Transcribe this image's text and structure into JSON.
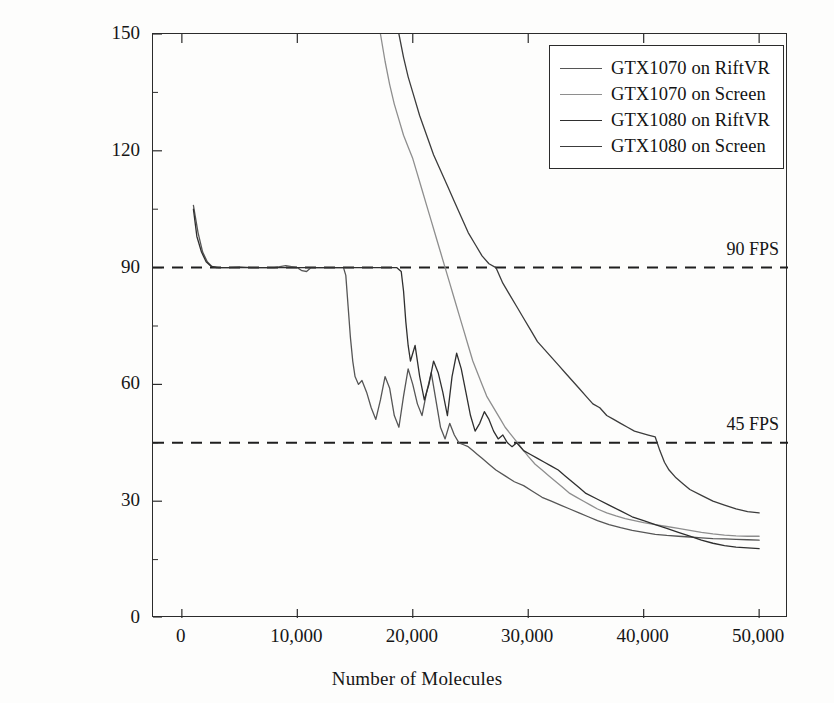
{
  "chart_data": {
    "type": "line",
    "title": "",
    "xlabel": "Number of Molecules",
    "ylabel": "Frames per Second (fps)",
    "xlim": [
      -2500,
      52500
    ],
    "ylim": [
      0,
      150
    ],
    "xticks": [
      0,
      10000,
      20000,
      30000,
      40000,
      50000
    ],
    "xticklabels": [
      "0",
      "10,000",
      "20,000",
      "30,000",
      "40,000",
      "50,000"
    ],
    "yticks": [
      0,
      30,
      60,
      90,
      120,
      150
    ],
    "yticklabels": [
      "0",
      "30",
      "60",
      "90",
      "120",
      "150"
    ],
    "grid": false,
    "legend_position": "top-right",
    "threshold_lines": [
      {
        "name": "90 FPS",
        "label": "90 FPS",
        "value": 90,
        "style": "dashed",
        "color": "#1f1f1f"
      },
      {
        "name": "45 FPS",
        "label": "45 FPS",
        "value": 45,
        "style": "dashed",
        "color": "#1f1f1f"
      }
    ],
    "series": [
      {
        "name": "GTX1070 on RiftVR",
        "color": "#565656",
        "x": [
          1000,
          1400,
          1800,
          2200,
          2600,
          3200,
          4000,
          5000,
          6000,
          7000,
          8000,
          9000,
          10000,
          10400,
          10800,
          11200,
          12000,
          13000,
          13600,
          14000,
          14200,
          14400,
          14600,
          14800,
          15000,
          15300,
          15600,
          16000,
          16400,
          16800,
          17200,
          17600,
          18000,
          18400,
          18800,
          19200,
          19600,
          20000,
          20400,
          20800,
          21200,
          21600,
          22000,
          22400,
          22800,
          23200,
          23600,
          24000,
          24400,
          24800,
          25200,
          25600,
          26000,
          26600,
          27200,
          28000,
          28800,
          29600,
          30400,
          31200,
          32000,
          32800,
          33600,
          34400,
          35200,
          36000,
          37000,
          38000,
          39000,
          40000,
          41000,
          42000,
          43000,
          44000,
          45000,
          46000,
          47000,
          48000,
          49000,
          50000
        ],
        "y": [
          106,
          99,
          94,
          91.5,
          90.3,
          90,
          90,
          90.2,
          90,
          90,
          90,
          90.5,
          90,
          89.2,
          89,
          90,
          90,
          90,
          90,
          90,
          88,
          80,
          72,
          66,
          62,
          60,
          61,
          58,
          54,
          51,
          56,
          62,
          59,
          52,
          49,
          57,
          64,
          60,
          55,
          52,
          58,
          63,
          56,
          49,
          46,
          50,
          47,
          45,
          44.5,
          44,
          43,
          42,
          41,
          39.5,
          38,
          36.5,
          35,
          34,
          32.5,
          31,
          30,
          29,
          28,
          27,
          26,
          25,
          24,
          23.2,
          22.5,
          22,
          21.5,
          21.2,
          21,
          20.8,
          20.6,
          20.4,
          20.3,
          20.2,
          20.1,
          20
        ]
      },
      {
        "name": "GTX1070 on Screen",
        "color": "#8e8e8e",
        "x": [
          17200,
          17600,
          18000,
          18400,
          18800,
          19200,
          19600,
          20000,
          20400,
          20800,
          21200,
          21600,
          22000,
          22400,
          22800,
          23200,
          23600,
          24000,
          24400,
          24800,
          25200,
          25600,
          26000,
          26400,
          26800,
          27200,
          27600,
          28000,
          28400,
          28800,
          29200,
          29600,
          30000,
          30600,
          31200,
          31800,
          32400,
          33000,
          33600,
          34200,
          34800,
          35400,
          36000,
          36800,
          37600,
          38400,
          39200,
          40000,
          41000,
          42000,
          43000,
          44000,
          45000,
          46000,
          47000,
          48000,
          49000,
          50000
        ],
        "y": [
          150,
          143,
          137,
          132,
          128,
          124,
          121,
          118,
          114,
          110,
          106,
          102,
          98,
          94,
          90,
          86,
          82,
          78,
          74,
          70,
          66,
          63,
          60,
          57,
          55,
          53,
          51,
          49,
          47.5,
          46,
          44.5,
          43,
          41.5,
          39.5,
          38,
          36.5,
          35,
          33.5,
          32,
          31,
          30,
          29,
          28,
          27,
          26.2,
          25.5,
          25,
          24.5,
          24,
          23.5,
          23,
          22.5,
          22,
          21.6,
          21.3,
          21.1,
          21,
          21
        ]
      },
      {
        "name": "GTX1080 on RiftVR",
        "color": "#2f2f2f",
        "x": [
          1000,
          1300,
          1700,
          2100,
          2500,
          3000,
          3600,
          4400,
          5200,
          6000,
          7000,
          8000,
          9000,
          10000,
          11000,
          12000,
          13000,
          14000,
          15000,
          16000,
          17000,
          18000,
          18600,
          19000,
          19200,
          19400,
          19600,
          19800,
          20200,
          20600,
          21000,
          21400,
          21800,
          22200,
          22600,
          23000,
          23400,
          23800,
          24200,
          24600,
          25000,
          25400,
          25800,
          26200,
          26600,
          27000,
          27400,
          27800,
          28200,
          28600,
          29000,
          29600,
          30200,
          30800,
          31400,
          32000,
          32600,
          33200,
          33800,
          34400,
          35000,
          36000,
          37000,
          38000,
          39000,
          40000,
          41000,
          42000,
          43000,
          44000,
          45000,
          46000,
          47000,
          48000,
          49000,
          50000
        ],
        "y": [
          105,
          98,
          94,
          91.5,
          90.4,
          90,
          90,
          90,
          90,
          90,
          90,
          90,
          90,
          90,
          90,
          90,
          90,
          90,
          90,
          90,
          90,
          90,
          90,
          89,
          84,
          76,
          70,
          66,
          70,
          62,
          56,
          60,
          66,
          63,
          58,
          52,
          62,
          68,
          64,
          58,
          52,
          48,
          50,
          53,
          51,
          48,
          46,
          47,
          45,
          44,
          45,
          43,
          42,
          41,
          40,
          39,
          38,
          36.5,
          35,
          33.5,
          32,
          30.5,
          29,
          27.5,
          26,
          25,
          24,
          23,
          22,
          21,
          20,
          19.2,
          18.6,
          18.2,
          18,
          17.8
        ]
      },
      {
        "name": "GTX1080 on Screen",
        "color": "#3c3c3c",
        "x": [
          18800,
          19200,
          19600,
          20000,
          20600,
          21200,
          21800,
          22400,
          23000,
          23600,
          24200,
          24800,
          25400,
          26000,
          26600,
          27200,
          27800,
          28400,
          29000,
          29600,
          30200,
          30800,
          31400,
          32000,
          32600,
          33200,
          33800,
          34400,
          35000,
          35600,
          36200,
          36800,
          37400,
          38000,
          38600,
          39200,
          39800,
          40400,
          41000,
          41400,
          41800,
          42200,
          42800,
          43400,
          44000,
          45000,
          46000,
          47000,
          48000,
          49000,
          50000
        ],
        "y": [
          150,
          144,
          139,
          135,
          129,
          124,
          119,
          115,
          111,
          107,
          103,
          99,
          96,
          93,
          91,
          90,
          86,
          83,
          80,
          77,
          74,
          71,
          69,
          67,
          65,
          63,
          61,
          59,
          57,
          55,
          54,
          52,
          51,
          50,
          49,
          48,
          47.5,
          47,
          46.5,
          43,
          40,
          38,
          36,
          34.5,
          33,
          31.5,
          30,
          29,
          28,
          27.3,
          27
        ]
      }
    ]
  },
  "legend": {
    "entries": [
      {
        "label": "GTX1070 on RiftVR",
        "color": "#565656"
      },
      {
        "label": "GTX1070 on Screen",
        "color": "#8e8e8e"
      },
      {
        "label": "GTX1080 on RiftVR",
        "color": "#2f2f2f"
      },
      {
        "label": "GTX1080 on Screen",
        "color": "#3c3c3c"
      }
    ]
  }
}
